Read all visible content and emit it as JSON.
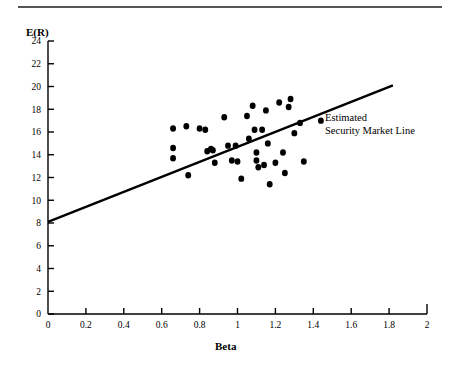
{
  "figure": {
    "title_rule": true,
    "annotation_lines": [
      "Estimated",
      "Security Market Line"
    ]
  },
  "chart_data": {
    "type": "scatter",
    "title": "",
    "subtitle": "",
    "xlabel": "Beta",
    "ylabel": "E(R)",
    "xlim": [
      0,
      2
    ],
    "ylim": [
      0,
      24
    ],
    "xticks": [
      "0",
      "0.2",
      "0.4",
      "0.6",
      "0.8",
      "1",
      "1.2",
      "1.4",
      "1.6",
      "1.8",
      "2"
    ],
    "xtick_values": [
      0,
      0.2,
      0.4,
      0.6,
      0.8,
      1.0,
      1.2,
      1.4,
      1.6,
      1.8,
      2.0
    ],
    "yticks": [
      "0",
      "2",
      "4",
      "6",
      "8",
      "10",
      "12",
      "14",
      "16",
      "18",
      "20",
      "22",
      "24"
    ],
    "ytick_values": [
      0,
      2,
      4,
      6,
      8,
      10,
      12,
      14,
      16,
      18,
      20,
      22,
      24
    ],
    "grid": false,
    "legend_position": "none",
    "marker_color": "#000000",
    "marker_size": 5.2,
    "line_color": "#000000",
    "line_width": 2.4,
    "annotations": [
      {
        "text": "Estimated Security Market Line",
        "lines": [
          "Estimated",
          "Security Market Line"
        ],
        "x": 1.46,
        "y": 17.0
      }
    ],
    "series": [
      {
        "name": "Estimated Security Market Line",
        "type": "line",
        "x": [
          0.0,
          1.82
        ],
        "y": [
          8.1,
          20.1
        ],
        "intercept": 8.1,
        "slope": 6.6
      },
      {
        "name": "Securities",
        "type": "scatter",
        "points": [
          [
            0.66,
            16.3
          ],
          [
            0.66,
            14.6
          ],
          [
            0.66,
            13.7
          ],
          [
            0.73,
            16.5
          ],
          [
            0.74,
            12.2
          ],
          [
            0.8,
            16.3
          ],
          [
            0.83,
            16.2
          ],
          [
            0.84,
            14.3
          ],
          [
            0.86,
            14.5
          ],
          [
            0.87,
            14.4
          ],
          [
            0.88,
            13.3
          ],
          [
            0.93,
            17.3
          ],
          [
            0.95,
            14.8
          ],
          [
            0.97,
            13.5
          ],
          [
            0.99,
            14.8
          ],
          [
            1.0,
            13.4
          ],
          [
            1.02,
            11.9
          ],
          [
            1.05,
            17.4
          ],
          [
            1.06,
            15.4
          ],
          [
            1.08,
            18.3
          ],
          [
            1.09,
            16.2
          ],
          [
            1.1,
            14.2
          ],
          [
            1.1,
            13.5
          ],
          [
            1.11,
            12.9
          ],
          [
            1.13,
            16.2
          ],
          [
            1.14,
            13.1
          ],
          [
            1.15,
            17.9
          ],
          [
            1.16,
            15.0
          ],
          [
            1.17,
            11.4
          ],
          [
            1.2,
            13.3
          ],
          [
            1.22,
            18.6
          ],
          [
            1.24,
            14.2
          ],
          [
            1.25,
            12.4
          ],
          [
            1.27,
            18.2
          ],
          [
            1.28,
            18.9
          ],
          [
            1.3,
            15.9
          ],
          [
            1.33,
            16.8
          ],
          [
            1.35,
            13.4
          ],
          [
            1.44,
            17.0
          ]
        ]
      }
    ]
  }
}
